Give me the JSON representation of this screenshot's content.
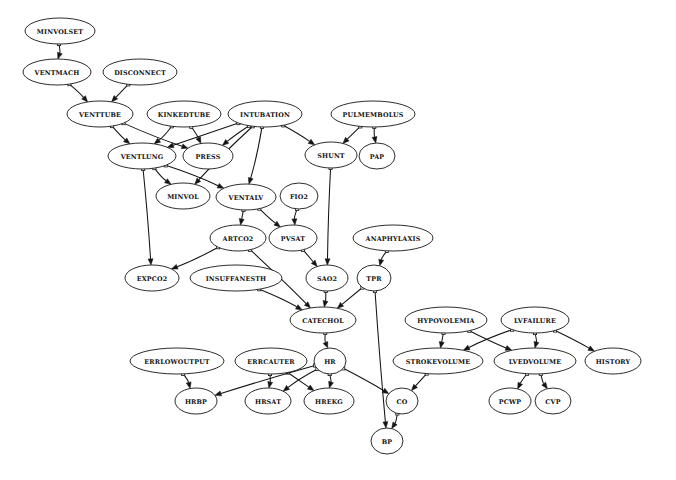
{
  "diagram": {
    "type": "directed-acyclic-graph",
    "background_color": "#ffffff",
    "node_fill_color": "#ffffff",
    "node_stroke_color": "#151515",
    "edge_color": "#141414",
    "label_color": "#101010",
    "width": 676,
    "height": 480
  },
  "nodes": [
    {
      "id": "MINVOLSET",
      "label": "MINVOLSET",
      "cx": 60,
      "cy": 31,
      "rx": 35,
      "ry": 13,
      "font_size": 6.4
    },
    {
      "id": "VENTMACH",
      "label": "VENTMACH",
      "cx": 57,
      "cy": 72,
      "rx": 34,
      "ry": 13,
      "font_size": 6.4
    },
    {
      "id": "DISCONNECT",
      "label": "DISCONNECT",
      "cx": 140,
      "cy": 72,
      "rx": 37,
      "ry": 13,
      "font_size": 6.4
    },
    {
      "id": "VENTTUBE",
      "label": "VENTTUBE",
      "cx": 100,
      "cy": 114,
      "rx": 33,
      "ry": 13,
      "font_size": 6.4
    },
    {
      "id": "KINKEDTUBE",
      "label": "KINKEDTUBE",
      "cx": 184,
      "cy": 114,
      "rx": 37,
      "ry": 13,
      "font_size": 6.4
    },
    {
      "id": "INTUBATION",
      "label": "INTUBATION",
      "cx": 265,
      "cy": 114,
      "rx": 37,
      "ry": 13,
      "font_size": 6.4
    },
    {
      "id": "PULMEMBOLUS",
      "label": "PULMEMBOLUS",
      "cx": 373,
      "cy": 114,
      "rx": 42,
      "ry": 13,
      "font_size": 6.4
    },
    {
      "id": "VENTLUNG",
      "label": "VENTLUNG",
      "cx": 142,
      "cy": 156,
      "rx": 34,
      "ry": 13,
      "font_size": 6.4
    },
    {
      "id": "PRESS",
      "label": "PRESS",
      "cx": 208,
      "cy": 156,
      "rx": 25,
      "ry": 13,
      "font_size": 6.4
    },
    {
      "id": "SHUNT",
      "label": "SHUNT",
      "cx": 331,
      "cy": 155,
      "rx": 26,
      "ry": 13,
      "font_size": 6.4
    },
    {
      "id": "PAP",
      "label": "PAP",
      "cx": 377,
      "cy": 156,
      "rx": 18,
      "ry": 13,
      "font_size": 6.4
    },
    {
      "id": "MINVOL",
      "label": "MINVOL",
      "cx": 183,
      "cy": 196,
      "rx": 27,
      "ry": 13,
      "font_size": 6.4
    },
    {
      "id": "VENTALV",
      "label": "VENTALV",
      "cx": 246,
      "cy": 197,
      "rx": 30,
      "ry": 13,
      "font_size": 6.4
    },
    {
      "id": "FIO2",
      "label": "FIO2",
      "cx": 299,
      "cy": 196,
      "rx": 19,
      "ry": 13,
      "font_size": 6.4
    },
    {
      "id": "ARTCO2",
      "label": "ARTCO2",
      "cx": 238,
      "cy": 238,
      "rx": 28,
      "ry": 13,
      "font_size": 6.4
    },
    {
      "id": "PVSAT",
      "label": "PVSAT",
      "cx": 293,
      "cy": 238,
      "rx": 24,
      "ry": 13,
      "font_size": 6.4
    },
    {
      "id": "ANAPHYLAXIS",
      "label": "ANAPHYLAXIS",
      "cx": 393,
      "cy": 238,
      "rx": 40,
      "ry": 13,
      "font_size": 6.4
    },
    {
      "id": "EXPCO2",
      "label": "EXPCO2",
      "cx": 152,
      "cy": 278,
      "rx": 27,
      "ry": 13,
      "font_size": 6.4
    },
    {
      "id": "INSUFFANESTH",
      "label": "INSUFFANESTH",
      "cx": 236,
      "cy": 278,
      "rx": 46,
      "ry": 13,
      "font_size": 6.4
    },
    {
      "id": "SAO2",
      "label": "SAO2",
      "cx": 327,
      "cy": 278,
      "rx": 21,
      "ry": 13,
      "font_size": 6.4
    },
    {
      "id": "TPR",
      "label": "TPR",
      "cx": 374,
      "cy": 278,
      "rx": 17,
      "ry": 13,
      "font_size": 6.4
    },
    {
      "id": "CATECHOL",
      "label": "CATECHOL",
      "cx": 323,
      "cy": 320,
      "rx": 33,
      "ry": 13,
      "font_size": 6.4
    },
    {
      "id": "HYPOVOLEMIA",
      "label": "HYPOVOLEMIA",
      "cx": 446,
      "cy": 320,
      "rx": 41,
      "ry": 13,
      "font_size": 6.4
    },
    {
      "id": "LVFAILURE",
      "label": "LVFAILURE",
      "cx": 535,
      "cy": 320,
      "rx": 34,
      "ry": 13,
      "font_size": 6.4
    },
    {
      "id": "ERRLOWOUTPUT",
      "label": "ERRLOWOUTPUT",
      "cx": 177,
      "cy": 361,
      "rx": 47,
      "ry": 13,
      "font_size": 6.4
    },
    {
      "id": "ERRCAUTER",
      "label": "ERRCAUTER",
      "cx": 271,
      "cy": 361,
      "rx": 36,
      "ry": 13,
      "font_size": 6.4
    },
    {
      "id": "HR",
      "label": "HR",
      "cx": 330,
      "cy": 361,
      "rx": 16,
      "ry": 13,
      "font_size": 6.4
    },
    {
      "id": "STROKEVOLUME",
      "label": "STROKEVOLUME",
      "cx": 438,
      "cy": 361,
      "rx": 45,
      "ry": 13,
      "font_size": 6.4
    },
    {
      "id": "LVEDVOLUME",
      "label": "LVEDVOLUME",
      "cx": 535,
      "cy": 361,
      "rx": 41,
      "ry": 13,
      "font_size": 6.4
    },
    {
      "id": "HISTORY",
      "label": "HISTORY",
      "cx": 613,
      "cy": 361,
      "rx": 28,
      "ry": 13,
      "font_size": 6.4
    },
    {
      "id": "HRBP",
      "label": "HRBP",
      "cx": 196,
      "cy": 401,
      "rx": 21,
      "ry": 13,
      "font_size": 6.4
    },
    {
      "id": "HRSAT",
      "label": "HRSAT",
      "cx": 268,
      "cy": 401,
      "rx": 23,
      "ry": 13,
      "font_size": 6.4
    },
    {
      "id": "HREKG",
      "label": "HREKG",
      "cx": 329,
      "cy": 401,
      "rx": 25,
      "ry": 13,
      "font_size": 6.4
    },
    {
      "id": "CO",
      "label": "CO",
      "cx": 402,
      "cy": 401,
      "rx": 16,
      "ry": 13,
      "font_size": 6.4
    },
    {
      "id": "PCWP",
      "label": "PCWP",
      "cx": 510,
      "cy": 401,
      "rx": 21,
      "ry": 13,
      "font_size": 6.4
    },
    {
      "id": "CVP",
      "label": "CVP",
      "cx": 553,
      "cy": 401,
      "rx": 18,
      "ry": 13,
      "font_size": 6.4
    },
    {
      "id": "BP",
      "label": "BP",
      "cx": 387,
      "cy": 441,
      "rx": 16,
      "ry": 13,
      "font_size": 6.4
    }
  ],
  "edges": [
    {
      "from": "MINVOLSET",
      "to": "VENTMACH"
    },
    {
      "from": "VENTMACH",
      "to": "VENTTUBE"
    },
    {
      "from": "DISCONNECT",
      "to": "VENTTUBE"
    },
    {
      "from": "VENTTUBE",
      "to": "VENTLUNG"
    },
    {
      "from": "VENTTUBE",
      "to": "PRESS"
    },
    {
      "from": "KINKEDTUBE",
      "to": "VENTLUNG"
    },
    {
      "from": "KINKEDTUBE",
      "to": "PRESS"
    },
    {
      "from": "INTUBATION",
      "to": "VENTLUNG"
    },
    {
      "from": "INTUBATION",
      "to": "PRESS"
    },
    {
      "from": "INTUBATION",
      "to": "MINVOL"
    },
    {
      "from": "INTUBATION",
      "to": "VENTALV"
    },
    {
      "from": "INTUBATION",
      "to": "SHUNT"
    },
    {
      "from": "PULMEMBOLUS",
      "to": "SHUNT"
    },
    {
      "from": "PULMEMBOLUS",
      "to": "PAP"
    },
    {
      "from": "VENTLUNG",
      "to": "MINVOL"
    },
    {
      "from": "VENTLUNG",
      "to": "VENTALV"
    },
    {
      "from": "VENTLUNG",
      "to": "EXPCO2"
    },
    {
      "from": "VENTALV",
      "to": "ARTCO2"
    },
    {
      "from": "VENTALV",
      "to": "PVSAT"
    },
    {
      "from": "FIO2",
      "to": "PVSAT"
    },
    {
      "from": "ARTCO2",
      "to": "EXPCO2"
    },
    {
      "from": "ARTCO2",
      "to": "CATECHOL"
    },
    {
      "from": "PVSAT",
      "to": "SAO2"
    },
    {
      "from": "SHUNT",
      "to": "SAO2"
    },
    {
      "from": "ANAPHYLAXIS",
      "to": "TPR"
    },
    {
      "from": "INSUFFANESTH",
      "to": "CATECHOL"
    },
    {
      "from": "SAO2",
      "to": "CATECHOL"
    },
    {
      "from": "TPR",
      "to": "CATECHOL"
    },
    {
      "from": "TPR",
      "to": "BP"
    },
    {
      "from": "CATECHOL",
      "to": "HR"
    },
    {
      "from": "ERRLOWOUTPUT",
      "to": "HRBP"
    },
    {
      "from": "ERRCAUTER",
      "to": "HRSAT"
    },
    {
      "from": "ERRCAUTER",
      "to": "HREKG"
    },
    {
      "from": "HR",
      "to": "HRBP"
    },
    {
      "from": "HR",
      "to": "HRSAT"
    },
    {
      "from": "HR",
      "to": "HREKG"
    },
    {
      "from": "HR",
      "to": "CO"
    },
    {
      "from": "HYPOVOLEMIA",
      "to": "STROKEVOLUME"
    },
    {
      "from": "HYPOVOLEMIA",
      "to": "LVEDVOLUME"
    },
    {
      "from": "LVFAILURE",
      "to": "STROKEVOLUME"
    },
    {
      "from": "LVFAILURE",
      "to": "LVEDVOLUME"
    },
    {
      "from": "LVFAILURE",
      "to": "HISTORY"
    },
    {
      "from": "STROKEVOLUME",
      "to": "CO"
    },
    {
      "from": "LVEDVOLUME",
      "to": "PCWP"
    },
    {
      "from": "LVEDVOLUME",
      "to": "CVP"
    },
    {
      "from": "CO",
      "to": "BP"
    }
  ]
}
